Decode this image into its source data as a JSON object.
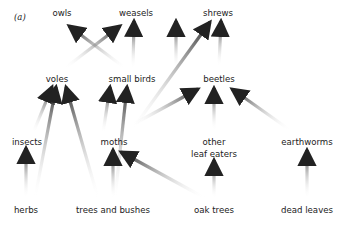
{
  "panel_label": "(a)",
  "nodes": [
    {
      "id": "owls",
      "label": "owls",
      "x": 62,
      "y": 13
    },
    {
      "id": "weasels",
      "label": "weasels",
      "x": 136,
      "y": 13
    },
    {
      "id": "shrews",
      "label": "shrews",
      "x": 217,
      "y": 13
    },
    {
      "id": "voles",
      "label": "voles",
      "x": 57,
      "y": 76
    },
    {
      "id": "small_birds",
      "label": "small birds",
      "x": 132,
      "y": 76
    },
    {
      "id": "beetles",
      "label": "beetles",
      "x": 219,
      "y": 76
    },
    {
      "id": "insects",
      "label": "insects",
      "x": 27,
      "y": 138
    },
    {
      "id": "moths",
      "label": "moths",
      "x": 112,
      "y": 138
    },
    {
      "id": "other_leaf_eaters",
      "label": "other",
      "label2": "leaf eaters",
      "x": 214,
      "y": 138
    },
    {
      "id": "earthworms",
      "label": "earthworms",
      "x": 307,
      "y": 138
    },
    {
      "id": "herbs",
      "label": "herbs",
      "x": 26,
      "y": 205
    },
    {
      "id": "trees_and_bushes",
      "label": "trees and bushes",
      "x": 113,
      "y": 205
    },
    {
      "id": "oak_trees",
      "label": "oak trees",
      "x": 214,
      "y": 205
    },
    {
      "id": "dead_leaves",
      "label": "dead leaves",
      "x": 307,
      "y": 205
    }
  ],
  "edges": [
    {
      "from": "voles",
      "to": "owls"
    },
    {
      "from": "small_birds",
      "to": "owls"
    },
    {
      "from": "voles",
      "to": "weasels"
    },
    {
      "from": "small_birds",
      "to": "weasels"
    },
    {
      "from": "moths",
      "to": "shrews"
    },
    {
      "from": "beetles",
      "to": "shrews"
    },
    {
      "from": "insects",
      "to": "voles"
    },
    {
      "from": "herbs",
      "to": "voles"
    },
    {
      "from": "trees_and_bushes",
      "to": "voles"
    },
    {
      "from": "moths",
      "to": "small_birds"
    },
    {
      "from": "trees_and_bushes",
      "to": "small_birds"
    },
    {
      "from": "moths",
      "to": "beetles"
    },
    {
      "from": "other_leaf_eaters",
      "to": "beetles"
    },
    {
      "from": "earthworms",
      "to": "beetles"
    },
    {
      "from": "herbs",
      "to": "insects"
    },
    {
      "from": "trees_and_bushes",
      "to": "moths"
    },
    {
      "from": "oak_trees",
      "to": "moths"
    },
    {
      "from": "oak_trees",
      "to": "other_leaf_eaters"
    },
    {
      "from": "dead_leaves",
      "to": "earthworms"
    }
  ]
}
